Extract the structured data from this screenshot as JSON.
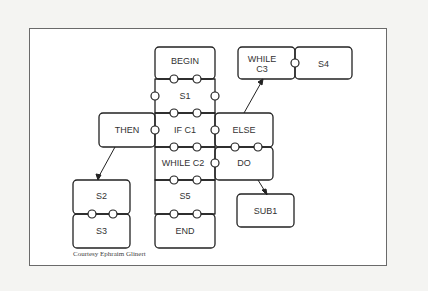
{
  "diagram": {
    "pieces": {
      "begin": "BEGIN",
      "s1": "S1",
      "then": "THEN",
      "if_c1": "IF C1",
      "else": "ELSE",
      "while_c2": "WHILE C2",
      "do": "DO",
      "s5": "S5",
      "end": "END",
      "s2": "S2",
      "s3": "S3",
      "while_c3_line1": "WHILE",
      "while_c3_line2": "C3",
      "s4": "S4",
      "sub1": "SUB1"
    },
    "credit": "Courtesy Ephraim Glinert"
  }
}
